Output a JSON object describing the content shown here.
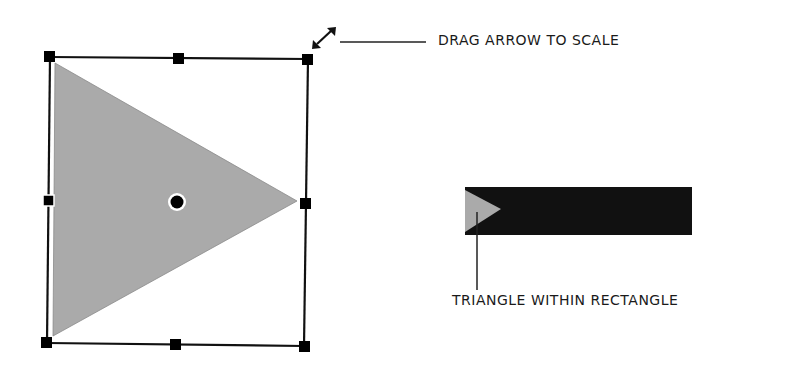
{
  "labels": {
    "drag_arrow": "DRAG ARROW TO SCALE",
    "triangle_within": "TRIANGLE WITHIN RECTANGLE"
  },
  "colors": {
    "triangle_fill": "#aaaaaa",
    "handle": "#000000",
    "outline": "#111111",
    "rectangle_fill": "#111111",
    "background": "#ffffff"
  },
  "selection": {
    "handles": [
      "top-left",
      "top-middle",
      "top-right",
      "middle-left",
      "middle-right",
      "bottom-left",
      "bottom-middle",
      "bottom-right"
    ],
    "center_point": "rotation-center"
  }
}
